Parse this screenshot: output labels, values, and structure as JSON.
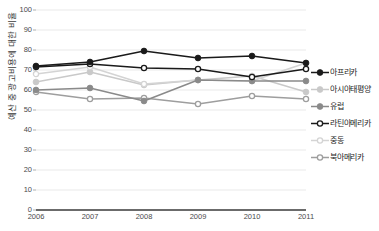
{
  "chart_data": {
    "type": "line",
    "title": "",
    "xlabel": "",
    "ylabel": "예산 중 광고비용에 대한 비율",
    "categories": [
      "2006",
      "2007",
      "2008",
      "2009",
      "2010",
      "2011"
    ],
    "ylim": [
      0,
      100
    ],
    "y_ticks": [
      0,
      10,
      20,
      30,
      40,
      50,
      60,
      70,
      80,
      90,
      100
    ],
    "grid": true,
    "legend_position": "right",
    "series": [
      {
        "name": "아프리카",
        "color": "#1a1a1a",
        "marker": "filled-diamond",
        "values": [
          72,
          74,
          79.5,
          76,
          77,
          73.5
        ]
      },
      {
        "name": "아시아태평양",
        "color": "#c9c9c9",
        "marker": "filled-diamond",
        "values": [
          64,
          69,
          62.5,
          65,
          67,
          59
        ]
      },
      {
        "name": "유럽",
        "color": "#8a8a8a",
        "marker": "filled-diamond",
        "values": [
          60,
          61,
          54.5,
          65,
          64.5,
          64.5
        ]
      },
      {
        "name": "라틴아메리카",
        "color": "#1a1a1a",
        "marker": "open-circle",
        "values": [
          71.5,
          73,
          71,
          70.5,
          66.5,
          70.5
        ]
      },
      {
        "name": "중동",
        "color": "#d4d4d4",
        "marker": "open-circle",
        "values": [
          68,
          71.5,
          63,
          65,
          64.5,
          73.5
        ]
      },
      {
        "name": "북아메리카",
        "color": "#9e9e9e",
        "marker": "open-circle",
        "values": [
          59,
          55.5,
          56,
          53,
          57,
          55.5
        ]
      }
    ]
  },
  "axis": {
    "y_title": "예산 중 광고비용에 대한 비율"
  }
}
